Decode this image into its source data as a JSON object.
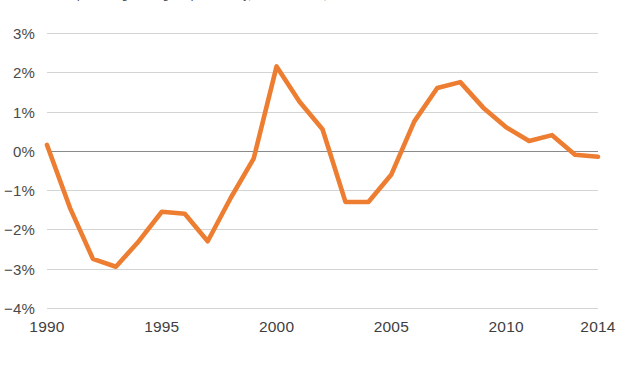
{
  "chart_data": {
    "type": "line",
    "title": "Annual percentage change in productivity, United States, 1990 to 2014",
    "subtitle": "",
    "xlabel": "",
    "ylabel": "",
    "x": [
      1990,
      1991,
      1992,
      1993,
      1994,
      1995,
      1996,
      1997,
      1998,
      1999,
      2000,
      2001,
      2002,
      2003,
      2004,
      2005,
      2006,
      2007,
      2008,
      2009,
      2010,
      2011,
      2012,
      2013,
      2014
    ],
    "values": [
      0.15,
      -1.45,
      -2.75,
      -2.95,
      -2.3,
      -1.55,
      -1.6,
      -2.3,
      -1.2,
      -0.2,
      2.15,
      1.25,
      0.55,
      -1.3,
      -1.3,
      -0.6,
      0.75,
      1.6,
      1.75,
      1.1,
      0.6,
      0.25,
      0.4,
      -0.1,
      -0.15
    ],
    "series": [
      {
        "name": "Annual change",
        "color": "#ED7D31",
        "values": [
          0.15,
          -1.45,
          -2.75,
          -2.95,
          -2.3,
          -1.55,
          -1.6,
          -2.3,
          -1.2,
          -0.2,
          2.15,
          1.25,
          0.55,
          -1.3,
          -1.3,
          -0.6,
          0.75,
          1.6,
          1.75,
          1.1,
          0.6,
          0.25,
          0.4,
          -0.1,
          -0.15
        ]
      }
    ],
    "xlim": [
      1990,
      2014
    ],
    "ylim": [
      -4,
      3
    ],
    "x_ticks": [
      1990,
      1995,
      2000,
      2005,
      2010,
      2014
    ],
    "x_tick_labels": [
      "1990",
      "1995",
      "2000",
      "2005",
      "2010",
      "2014"
    ],
    "y_ticks": [
      3,
      2,
      1,
      0,
      -1,
      -2,
      -3,
      -4
    ],
    "y_tick_labels": [
      "3%",
      "2%",
      "1%",
      "0%",
      "−1%",
      "−2%",
      "−3%",
      "−4%"
    ],
    "grid": true,
    "zero_line": true,
    "legend": "none",
    "annotations": []
  },
  "colors": {
    "series": "#ED7D31",
    "grid": "#d4d4d4",
    "zero_line": "#8a8a8a",
    "tick_text": "#4a4a4a",
    "background": "#ffffff"
  }
}
